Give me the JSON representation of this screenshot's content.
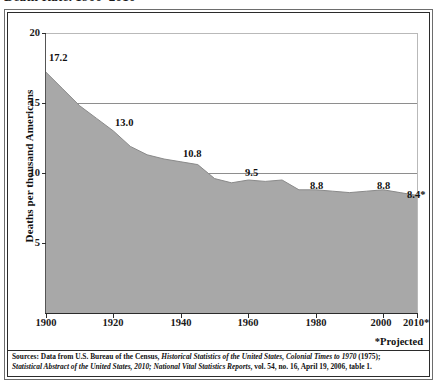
{
  "title": "Death Rate, 1900–2010",
  "yaxis_title": "Deaths per thousand Americans",
  "projected_note": "*Projected",
  "source": {
    "line1_prefix": "Sources: Data from U.S. Bureau of the Census, ",
    "line1_italic": "Historical Statistics of the United States, Colonial Times to 1970",
    "line1_suffix": " (1975);",
    "line2_italic_a": "Statistical Abstract of the United States, 2010;",
    "line2_italic_b": " National Vital Statistics Reports",
    "line2_suffix": ", vol. 54, no. 16, April 19, 2006, table 1."
  },
  "colors": {
    "area_fill": "#a8a8a8",
    "area_edge": "#8a8a8a",
    "gridline": "#8e8e8e",
    "axis": "#2b2b2b",
    "text": "#111111",
    "background": "#ffffff"
  },
  "chart_data": {
    "type": "area",
    "title": "Death Rate, 1900–2010",
    "xlabel": "",
    "ylabel": "Deaths per thousand Americans",
    "xlim": [
      1900,
      2010
    ],
    "ylim": [
      0,
      20
    ],
    "grid": true,
    "legend": false,
    "xticks": [
      "1900",
      "1920",
      "1940",
      "1960",
      "1980",
      "2000",
      "2010*"
    ],
    "xtick_values": [
      1900,
      1920,
      1940,
      1960,
      1980,
      2000,
      2010
    ],
    "yticks": [
      "5",
      "10",
      "15",
      "20"
    ],
    "ytick_values": [
      5,
      10,
      15,
      20
    ],
    "x": [
      1900,
      1905,
      1910,
      1915,
      1920,
      1925,
      1930,
      1935,
      1940,
      1945,
      1950,
      1955,
      1960,
      1965,
      1970,
      1975,
      1980,
      1985,
      1990,
      1995,
      2000,
      2005,
      2010
    ],
    "values": [
      17.2,
      16.0,
      14.8,
      13.9,
      13.0,
      11.9,
      11.3,
      11.0,
      10.8,
      10.6,
      9.6,
      9.3,
      9.5,
      9.4,
      9.5,
      8.8,
      8.8,
      8.7,
      8.6,
      8.7,
      8.8,
      8.6,
      8.4
    ],
    "labeled_points": [
      {
        "x": 1900,
        "y": 17.2,
        "label": "17.2"
      },
      {
        "x": 1920,
        "y": 13.0,
        "label": "13.0"
      },
      {
        "x": 1940,
        "y": 10.8,
        "label": "10.8"
      },
      {
        "x": 1960,
        "y": 9.5,
        "label": "9.5"
      },
      {
        "x": 1980,
        "y": 8.8,
        "label": "8.8"
      },
      {
        "x": 2000,
        "y": 8.8,
        "label": "8.8"
      },
      {
        "x": 2010,
        "y": 8.4,
        "label": "8.4*"
      }
    ]
  }
}
